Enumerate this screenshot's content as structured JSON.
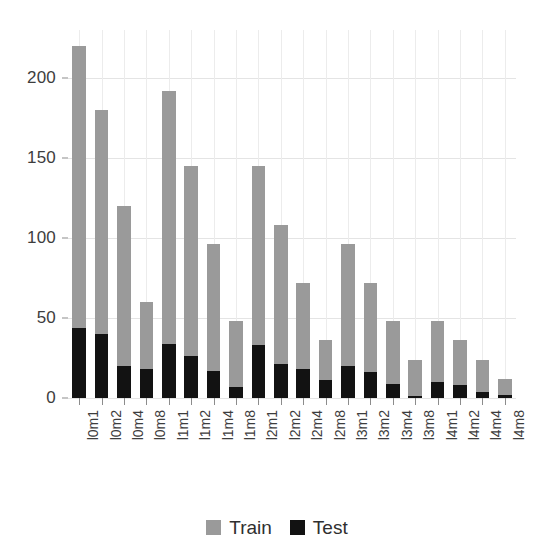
{
  "chart_data": {
    "type": "bar",
    "stacked": true,
    "title": "",
    "subtitle": "",
    "xlabel": "",
    "ylabel": "",
    "ylim": [
      0,
      230
    ],
    "yticks": [
      0,
      50,
      100,
      150,
      200
    ],
    "grid": true,
    "legend_position": "bottom",
    "categories": [
      "l0m1",
      "l0m2",
      "l0m4",
      "l0m8",
      "l1m1",
      "l1m2",
      "l1m4",
      "l1m8",
      "l2m1",
      "l2m2",
      "l2m4",
      "l2m8",
      "l3m1",
      "l3m2",
      "l3m4",
      "l3m8",
      "l4m1",
      "l4m2",
      "l4m4",
      "l4m8"
    ],
    "series": [
      {
        "name": "Test",
        "color": "#121212",
        "values": [
          44,
          40,
          20,
          18,
          34,
          26,
          17,
          7,
          33,
          21,
          18,
          11,
          20,
          16,
          9,
          1,
          10,
          8,
          4,
          2
        ]
      },
      {
        "name": "Train",
        "color": "#9a9a9a",
        "values": [
          176,
          140,
          100,
          42,
          158,
          119,
          79,
          41,
          112,
          87,
          54,
          25,
          76,
          56,
          39,
          23,
          38,
          28,
          20,
          10
        ]
      }
    ],
    "totals": [
      220,
      180,
      120,
      60,
      192,
      145,
      96,
      48,
      145,
      108,
      72,
      36,
      96,
      72,
      48,
      24,
      48,
      36,
      24,
      12
    ]
  },
  "legend": {
    "items": [
      {
        "label": "Train",
        "swatch": "train-swatch",
        "color": "#9a9a9a"
      },
      {
        "label": "Test",
        "swatch": "test-swatch",
        "color": "#121212"
      }
    ]
  }
}
